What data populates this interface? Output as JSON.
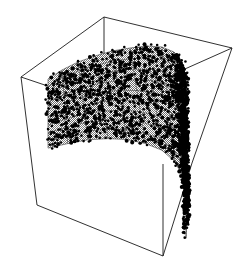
{
  "figure": {
    "title": "",
    "type": "3d-scatter-surface-plot",
    "width": 246,
    "height": 272,
    "background_color": "#ffffff",
    "line_color": "#1a1a1a",
    "surface_fill_color": "#a8a8a8",
    "surface_dither": "50-percent-checkerboard",
    "point_color": "#000000",
    "axis_line_width": 0.9
  },
  "chart_data": {
    "type": "scatter",
    "title": "",
    "subtitle": "",
    "xlabel": "",
    "ylabel": "",
    "zlabel": "",
    "xticklabels": [],
    "yticklabels": [],
    "zticklabels": [],
    "legend": [],
    "grid": false,
    "legend_position": "none",
    "projection": "3d",
    "xlim": [
      0,
      1
    ],
    "ylim": [
      0,
      1
    ],
    "zlim": [
      0,
      1
    ],
    "n_points": 2200,
    "point_size_px": 2.6,
    "surface_description": "curved saddle / half-cylinder mesh sheet bending from upper-left across to a steep descent at right",
    "mesh_rows": 9,
    "mesh_cols": 11,
    "box_corners_px": {
      "back_top": [
        104,
        17
      ],
      "left_top": [
        21,
        77
      ],
      "right_top": [
        232,
        48
      ],
      "front_top": [
        147,
        112
      ],
      "back_bottom": [
        104,
        105
      ],
      "left_bottom": [
        37,
        205
      ],
      "right_bottom": [
        192,
        163
      ],
      "front_bottom": [
        163,
        256
      ]
    },
    "surface_grid_u": [
      [
        48,
        79
      ],
      [
        62,
        70
      ],
      [
        78,
        62
      ],
      [
        95,
        56
      ],
      [
        112,
        51
      ],
      [
        130,
        48
      ],
      [
        147,
        46
      ],
      [
        162,
        47
      ],
      [
        174,
        52
      ],
      [
        182,
        62
      ],
      [
        186,
        78
      ]
    ],
    "surface_depth_dx": 52,
    "surface_depth_dy": 38,
    "surface_height_dy": 96
  },
  "elements": {
    "plot_area_name": "3d-plot-area",
    "box_name": "bounding-box-wireframe",
    "surface_name": "mesh-surface",
    "points_name": "scatter-points"
  }
}
